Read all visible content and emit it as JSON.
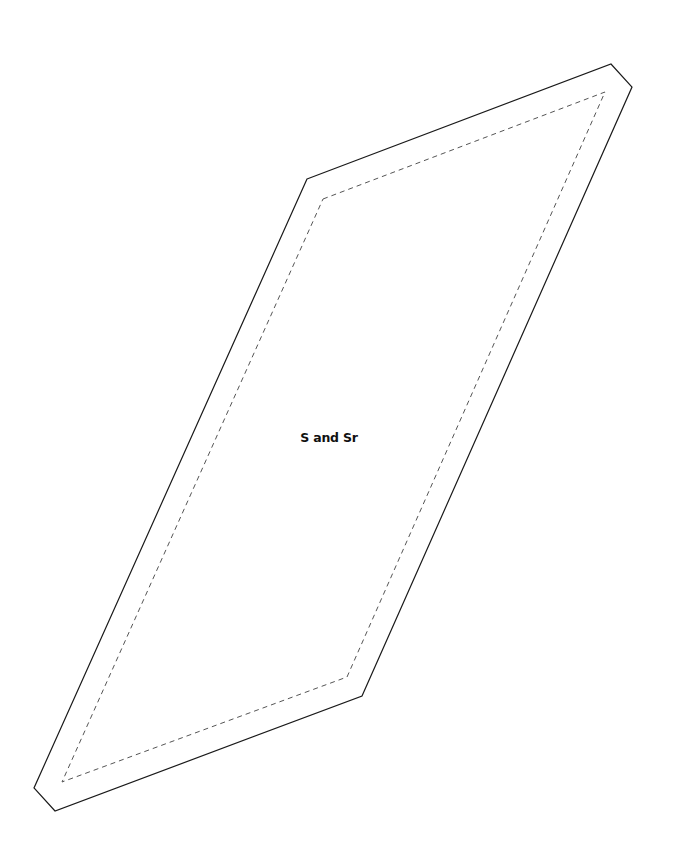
{
  "diagram": {
    "type": "quilt-pattern-piece",
    "shape": "parallelogram-with-clipped-corners",
    "label": "S and Sr",
    "label_position": {
      "x": 329,
      "y": 437
    },
    "outer_outline": {
      "stroke": "#1a1a1a",
      "style": "solid",
      "points": [
        [
          307,
          179
        ],
        [
          611,
          64
        ],
        [
          632,
          87
        ],
        [
          362,
          696
        ],
        [
          55,
          811
        ],
        [
          34,
          788
        ]
      ]
    },
    "seam_line": {
      "stroke": "#555555",
      "style": "dashed",
      "points": [
        [
          323,
          199
        ],
        [
          605,
          92
        ],
        [
          347,
          677
        ],
        [
          62,
          782
        ]
      ]
    }
  }
}
